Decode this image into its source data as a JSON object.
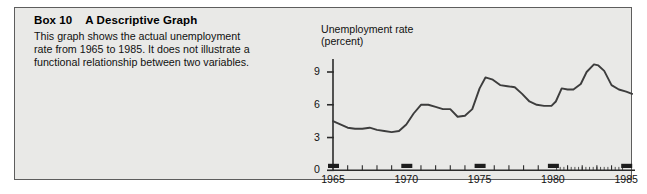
{
  "box": {
    "label": "Box 10",
    "title": "A Descriptive Graph",
    "body_lines": [
      "This graph shows the actual unemployment",
      "rate from 1965 to 1985. It does not illustrate a",
      "functional relationship between two variables."
    ]
  },
  "chart_data": {
    "type": "line",
    "title": "",
    "axis_title_lines": [
      "Unemployment rate",
      "(percent)"
    ],
    "ylabel": "Unemployment rate (percent)",
    "xlabel": "",
    "ylim": [
      0,
      10.5
    ],
    "xlim": [
      1965,
      1985.6
    ],
    "yticks": [
      0,
      3,
      6,
      9
    ],
    "ytick_labels": [
      "0",
      "3",
      "6",
      "9"
    ],
    "xticks": [
      1965,
      1970,
      1975,
      1980,
      1985
    ],
    "xtick_labels": [
      "1965",
      "1970",
      "1975",
      "1980",
      "1985"
    ],
    "grid": false,
    "legend": "none",
    "line_color": "#3d3d3d",
    "series": [
      {
        "name": "Unemployment rate",
        "x": [
          1965.0,
          1965.5,
          1966.0,
          1966.5,
          1967.0,
          1967.5,
          1968.0,
          1968.5,
          1969.0,
          1969.5,
          1970.0,
          1970.5,
          1971.0,
          1971.5,
          1972.0,
          1972.5,
          1973.0,
          1973.5,
          1974.0,
          1974.5,
          1975.0,
          1975.4,
          1975.9,
          1976.4,
          1976.9,
          1977.4,
          1977.9,
          1978.4,
          1978.9,
          1979.4,
          1979.9,
          1980.2,
          1980.6,
          1981.0,
          1981.4,
          1981.9,
          1982.3,
          1982.8,
          1983.1,
          1983.5,
          1984.0,
          1984.5,
          1985.0,
          1985.4
        ],
        "values": [
          4.5,
          4.2,
          3.9,
          3.8,
          3.8,
          3.9,
          3.7,
          3.6,
          3.5,
          3.6,
          4.2,
          5.2,
          6.0,
          6.0,
          5.8,
          5.6,
          5.6,
          4.9,
          5.0,
          5.6,
          7.5,
          8.5,
          8.3,
          7.8,
          7.7,
          7.6,
          7.0,
          6.3,
          6.0,
          5.9,
          5.9,
          6.3,
          7.5,
          7.4,
          7.4,
          7.9,
          9.0,
          9.7,
          9.6,
          9.1,
          7.8,
          7.4,
          7.2,
          7.0
        ]
      }
    ]
  }
}
